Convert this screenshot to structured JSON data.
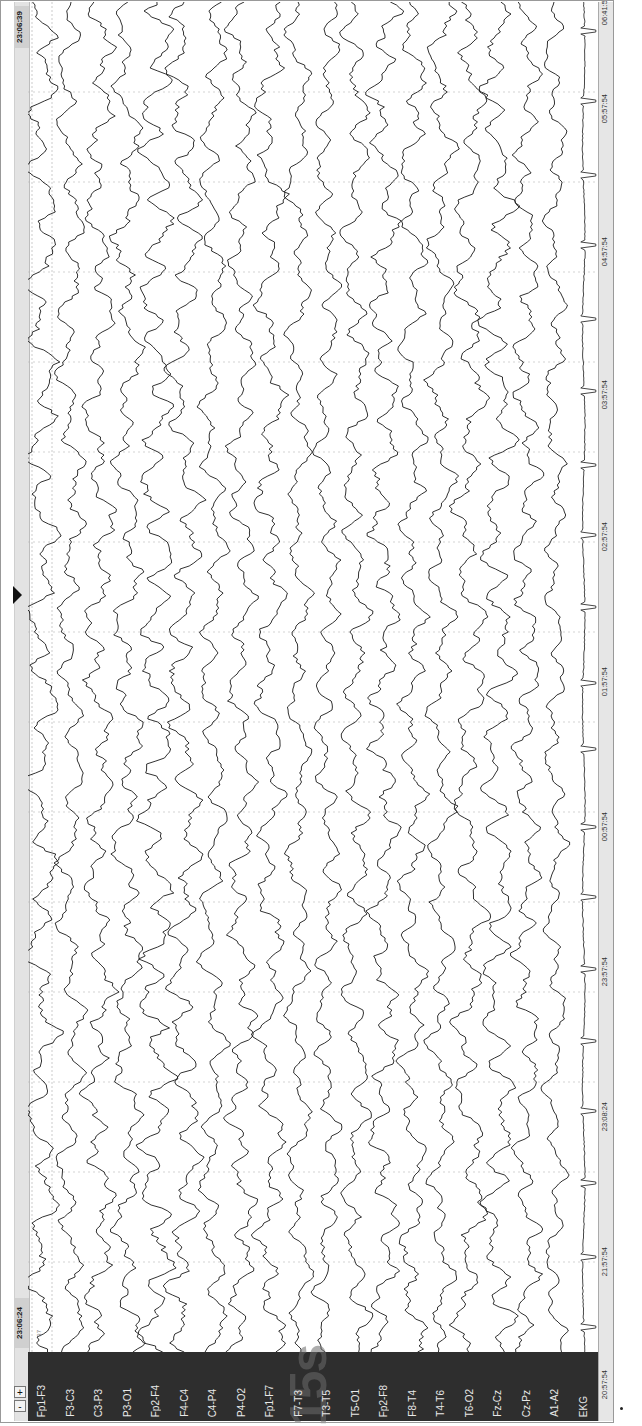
{
  "viewer": {
    "header": {
      "start_time": "23:06:24",
      "end_time": "23:06:39",
      "zoom_out_label": "-",
      "zoom_in_label": "+",
      "marker_label": "37"
    },
    "timebase_watermark": "15s",
    "channels": [
      {
        "label": "Fp1-F3",
        "amp": 12,
        "seed": 1
      },
      {
        "label": "F3-C3",
        "amp": 10,
        "seed": 2
      },
      {
        "label": "C3-P3",
        "amp": 11,
        "seed": 3
      },
      {
        "label": "P3-O1",
        "amp": 11,
        "seed": 4
      },
      {
        "label": "Fp2-F4",
        "amp": 13,
        "seed": 5
      },
      {
        "label": "F4-C4",
        "amp": 12,
        "seed": 6
      },
      {
        "label": "C4-P4",
        "amp": 10,
        "seed": 7
      },
      {
        "label": "P4-O2",
        "amp": 10,
        "seed": 8
      },
      {
        "label": "Fp1-F7",
        "amp": 11,
        "seed": 9
      },
      {
        "label": "F7-T3",
        "amp": 9,
        "seed": 10
      },
      {
        "label": "T3-T5",
        "amp": 9,
        "seed": 11
      },
      {
        "label": "T5-O1",
        "amp": 10,
        "seed": 12
      },
      {
        "label": "Fp2-F8",
        "amp": 11,
        "seed": 13
      },
      {
        "label": "F8-T4",
        "amp": 10,
        "seed": 14
      },
      {
        "label": "T4-T6",
        "amp": 10,
        "seed": 15
      },
      {
        "label": "T6-O2",
        "amp": 12,
        "seed": 16
      },
      {
        "label": "Fz-Cz",
        "amp": 12,
        "seed": 17
      },
      {
        "label": "Cz-Pz",
        "amp": 10,
        "seed": 18
      },
      {
        "label": "A1-A2",
        "amp": 8,
        "seed": 19
      },
      {
        "label": "EKG",
        "amp": 4,
        "seed": 20,
        "ekg": true
      }
    ],
    "time_axis": {
      "labels": [
        {
          "text": "20:57:54",
          "y": 1388
        },
        {
          "text": "21:57:54",
          "y": 1265
        },
        {
          "text": "23:08:24",
          "y": 1120
        },
        {
          "text": "23:57:54",
          "y": 975
        },
        {
          "text": "00:57:54",
          "y": 830
        },
        {
          "text": "01:57:54",
          "y": 685
        },
        {
          "text": "02:57:54",
          "y": 540
        },
        {
          "text": "03:57:54",
          "y": 398
        },
        {
          "text": "04:57:54",
          "y": 255
        },
        {
          "text": "05:57:54",
          "y": 112
        },
        {
          "text": "06:41:54",
          "y": 14
        }
      ]
    },
    "colors": {
      "trace": "#1a1a1a",
      "ekg_trace": "#333333",
      "grid": "#b5b5b5",
      "label_panel": "#2e2e2e",
      "label_text": "#e8e8e8"
    }
  }
}
